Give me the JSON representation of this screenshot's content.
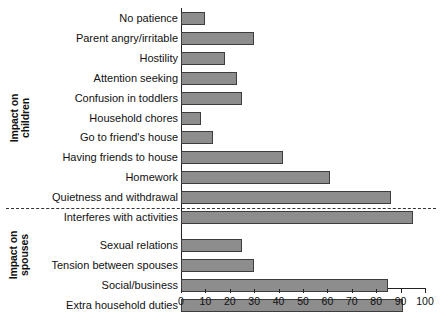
{
  "chart_data": {
    "type": "bar",
    "orientation": "horizontal",
    "title": "",
    "xlabel": "",
    "ylabel": "",
    "xlim": [
      0,
      100
    ],
    "xticks": [
      0,
      10,
      20,
      30,
      40,
      50,
      60,
      70,
      80,
      90,
      100
    ],
    "grid": false,
    "legend": null,
    "bar_color": "#8d8d8d",
    "bar_edge_color": "#3d3d3d",
    "groups": [
      {
        "name": "Impact on\nchildren",
        "categories": [
          "No patience",
          "Parent angry/irritable",
          "Hostility",
          "Attention seeking",
          "Confusion in toddlers",
          "Household chores",
          "Go to friend's house",
          "Having friends to house",
          "Homework",
          "Quietness and withdrawal",
          "Interferes with activities"
        ],
        "values": [
          10,
          30,
          18,
          23,
          25,
          8,
          13,
          42,
          61,
          86,
          95
        ]
      },
      {
        "name": "Impact on\nspouses",
        "categories": [
          "Sexual relations",
          "Tension between spouses",
          "Social/business",
          "Extra household duties"
        ],
        "values": [
          25,
          30,
          85,
          91
        ]
      }
    ],
    "categories": [
      "No patience",
      "Parent angry/irritable",
      "Hostility",
      "Attention seeking",
      "Confusion in toddlers",
      "Household chores",
      "Go to friend's house",
      "Having friends to house",
      "Homework",
      "Quietness and withdrawal",
      "Interferes with activities",
      "Sexual relations",
      "Tension between spouses",
      "Social/business",
      "Extra household duties"
    ],
    "values": [
      10,
      30,
      18,
      23,
      25,
      8,
      13,
      42,
      61,
      86,
      95,
      25,
      30,
      85,
      91
    ]
  }
}
